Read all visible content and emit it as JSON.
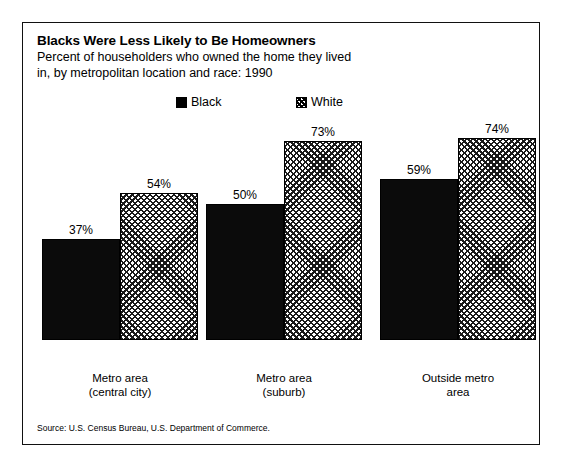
{
  "figure": {
    "title": "Blacks Were Less Likely to Be Homeowners",
    "subtitle_line1": "Percent of householders who owned the home they lived",
    "subtitle_line2": "in, by metropolitan location and race:  1990",
    "source": "Source:  U.S. Census Bureau, U.S. Department of Commerce."
  },
  "legend": {
    "items": [
      {
        "label": "Black",
        "swatch": "solid-black-square-icon",
        "color": "#000000"
      },
      {
        "label": "White",
        "swatch": "hatched-square-icon",
        "color": "#ffffff"
      }
    ]
  },
  "chart_data": {
    "type": "bar",
    "title": "Blacks Were Less Likely to Be Homeowners",
    "subtitle": "Percent of householders who owned the home they lived in, by metropolitan location and race:  1990",
    "xlabel": "",
    "ylabel": "",
    "ylim": [
      0,
      100
    ],
    "grid": false,
    "legend_position": "top-center",
    "axis_visible": false,
    "value_label_suffix": "%",
    "categories": [
      "Metro area (central city)",
      "Metro area (suburb)",
      "Outside metro area"
    ],
    "category_lines": [
      [
        "Metro area",
        "(central city)"
      ],
      [
        "Metro area",
        "(suburb)"
      ],
      [
        "Outside metro",
        "area"
      ]
    ],
    "series": [
      {
        "name": "Black",
        "values": [
          37,
          50,
          59
        ],
        "labels": [
          "37%",
          "50%",
          "59%"
        ]
      },
      {
        "name": "White",
        "values": [
          54,
          73,
          74
        ],
        "labels": [
          "54%",
          "73%",
          "74%"
        ]
      }
    ],
    "source": "Source:  U.S. Census Bureau, U.S. Department of Commerce."
  },
  "geometry": {
    "baseline_y": 319,
    "px_per_percent": 2.73,
    "bar_width": 78,
    "group_left": [
      19,
      183,
      357
    ]
  }
}
